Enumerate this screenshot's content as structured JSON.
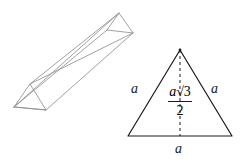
{
  "figure": {
    "background_color": "#ffffff",
    "prism": {
      "name": "triangular prism",
      "stroke_color": "#8a8a8a",
      "stroke_width": 0.8,
      "near_triangle": {
        "left": [
          14,
          107
        ],
        "apex": [
          30,
          84
        ],
        "right": [
          46,
          110
        ]
      },
      "far_triangle": {
        "left": [
          107,
          30
        ],
        "apex": [
          119,
          13
        ],
        "right": [
          133,
          33
        ]
      }
    },
    "triangle": {
      "name": "equilateral triangle",
      "stroke_color": "#1a1a1a",
      "stroke_width": 1.2,
      "apex": [
        180,
        50
      ],
      "base_left": [
        128,
        136
      ],
      "base_right": [
        232,
        136
      ],
      "altitude": {
        "style": "dashed",
        "from": [
          180,
          50
        ],
        "to": [
          180,
          136
        ]
      }
    },
    "labels": {
      "side_left": "a",
      "side_right": "a",
      "base": "a",
      "altitude_numerator_variable": "a",
      "altitude_numerator_radical": "√3",
      "altitude_denominator": "2",
      "altitude_full": "a√3/2"
    }
  }
}
